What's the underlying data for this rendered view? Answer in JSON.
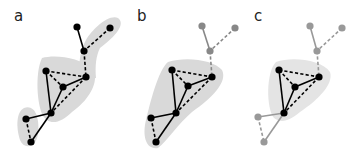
{
  "figure": {
    "panels": [
      {
        "id": "a",
        "label": "a",
        "label_pos": [
          14,
          21
        ],
        "highlight_regions": [
          {
            "name": "top-arm",
            "path": "M 86 40 C 92 30 108 14 118 18 C 126 24 116 36 100 48 C 96 56 95 66 96 78 L 80 80 C 78 64 80 50 86 40 Z",
            "color": "#d9d9d9"
          },
          {
            "name": "core",
            "path": "M 42 58 C 56 54 80 58 92 68 C 100 78 92 98 72 112 C 60 124 48 126 42 114 C 36 98 36 70 42 58 Z",
            "color": "#d9d9d9"
          },
          {
            "name": "bottom",
            "path": "M 24 108 C 34 104 40 116 38 134 C 36 148 24 150 20 140 C 16 128 16 112 24 108 Z",
            "color": "#d9d9d9"
          }
        ],
        "nodes": [
          {
            "id": 1,
            "x": 77,
            "y": 27,
            "color": "#000000"
          },
          {
            "id": 2,
            "x": 110,
            "y": 28,
            "color": "#000000"
          },
          {
            "id": 3,
            "x": 84,
            "y": 51,
            "color": "#000000"
          },
          {
            "id": 4,
            "x": 46,
            "y": 71,
            "color": "#000000"
          },
          {
            "id": 5,
            "x": 86,
            "y": 77,
            "color": "#000000"
          },
          {
            "id": 6,
            "x": 63,
            "y": 87,
            "color": "#000000"
          },
          {
            "id": 7,
            "x": 51,
            "y": 113,
            "color": "#000000"
          },
          {
            "id": 8,
            "x": 26,
            "y": 119,
            "color": "#000000"
          },
          {
            "id": 9,
            "x": 31,
            "y": 142,
            "color": "#000000"
          }
        ],
        "edges": [
          {
            "from": 1,
            "to": 3,
            "style": "solid",
            "color": "#000000"
          },
          {
            "from": 2,
            "to": 3,
            "style": "dashed",
            "color": "#000000"
          },
          {
            "from": 3,
            "to": 5,
            "style": "dashed",
            "color": "#000000"
          },
          {
            "from": 4,
            "to": 5,
            "style": "dashed",
            "color": "#000000"
          },
          {
            "from": 4,
            "to": 6,
            "style": "dashed",
            "color": "#000000"
          },
          {
            "from": 4,
            "to": 7,
            "style": "solid",
            "color": "#000000"
          },
          {
            "from": 6,
            "to": 5,
            "style": "solid",
            "color": "#000000"
          },
          {
            "from": 6,
            "to": 7,
            "style": "solid",
            "color": "#000000"
          },
          {
            "from": 5,
            "to": 7,
            "style": "dashed",
            "color": "#000000"
          },
          {
            "from": 7,
            "to": 8,
            "style": "solid",
            "color": "#000000"
          },
          {
            "from": 7,
            "to": 9,
            "style": "solid",
            "color": "#000000"
          },
          {
            "from": 8,
            "to": 9,
            "style": "dashed",
            "color": "#000000"
          }
        ]
      },
      {
        "id": "b",
        "label": "b",
        "label_pos": [
          137,
          21
        ],
        "highlight_regions": [
          {
            "name": "main",
            "path": "M 168 62 C 186 56 214 60 222 70 C 228 82 212 98 192 112 C 178 124 168 140 158 148 C 146 150 142 136 146 120 C 150 104 158 70 168 62 Z",
            "color": "#d9d9d9"
          }
        ],
        "nodes": [
          {
            "id": 1,
            "x": 202,
            "y": 26,
            "color": "#888888"
          },
          {
            "id": 2,
            "x": 235,
            "y": 28,
            "color": "#888888"
          },
          {
            "id": 3,
            "x": 210,
            "y": 51,
            "color": "#888888"
          },
          {
            "id": 4,
            "x": 172,
            "y": 70,
            "color": "#000000"
          },
          {
            "id": 5,
            "x": 212,
            "y": 77,
            "color": "#000000"
          },
          {
            "id": 6,
            "x": 188,
            "y": 86,
            "color": "#000000"
          },
          {
            "id": 7,
            "x": 176,
            "y": 113,
            "color": "#000000"
          },
          {
            "id": 8,
            "x": 151,
            "y": 118,
            "color": "#000000"
          },
          {
            "id": 9,
            "x": 156,
            "y": 142,
            "color": "#000000"
          }
        ],
        "edges": [
          {
            "from": 1,
            "to": 3,
            "style": "solid",
            "color": "#888888"
          },
          {
            "from": 2,
            "to": 3,
            "style": "dashed",
            "color": "#888888"
          },
          {
            "from": 3,
            "to": 5,
            "style": "dashed",
            "color": "#888888"
          },
          {
            "from": 4,
            "to": 5,
            "style": "dashed",
            "color": "#000000"
          },
          {
            "from": 4,
            "to": 6,
            "style": "dashed",
            "color": "#000000"
          },
          {
            "from": 4,
            "to": 7,
            "style": "solid",
            "color": "#000000"
          },
          {
            "from": 6,
            "to": 5,
            "style": "solid",
            "color": "#000000"
          },
          {
            "from": 6,
            "to": 7,
            "style": "solid",
            "color": "#000000"
          },
          {
            "from": 5,
            "to": 7,
            "style": "dashed",
            "color": "#000000"
          },
          {
            "from": 7,
            "to": 8,
            "style": "solid",
            "color": "#000000"
          },
          {
            "from": 7,
            "to": 9,
            "style": "solid",
            "color": "#000000"
          },
          {
            "from": 8,
            "to": 9,
            "style": "dashed",
            "color": "#000000"
          }
        ]
      },
      {
        "id": "c",
        "label": "c",
        "label_pos": [
          254,
          21
        ],
        "highlight_regions": [
          {
            "name": "triangle",
            "path": "M 276 62 C 292 56 322 60 330 72 C 334 84 318 100 300 112 C 290 120 282 124 274 118 C 266 108 266 72 276 62 Z",
            "color": "#e4e4e4"
          }
        ],
        "nodes": [
          {
            "id": 1,
            "x": 310,
            "y": 26,
            "color": "#999999"
          },
          {
            "id": 2,
            "x": 342,
            "y": 28,
            "color": "#999999"
          },
          {
            "id": 3,
            "x": 317,
            "y": 51,
            "color": "#999999"
          },
          {
            "id": 4,
            "x": 279,
            "y": 70,
            "color": "#000000"
          },
          {
            "id": 5,
            "x": 319,
            "y": 77,
            "color": "#000000"
          },
          {
            "id": 6,
            "x": 295,
            "y": 87,
            "color": "#000000"
          },
          {
            "id": 7,
            "x": 284,
            "y": 113,
            "color": "#000000"
          },
          {
            "id": 8,
            "x": 258,
            "y": 117,
            "color": "#999999"
          },
          {
            "id": 9,
            "x": 264,
            "y": 142,
            "color": "#999999"
          }
        ],
        "edges": [
          {
            "from": 1,
            "to": 3,
            "style": "solid",
            "color": "#999999"
          },
          {
            "from": 2,
            "to": 3,
            "style": "dashed",
            "color": "#999999"
          },
          {
            "from": 3,
            "to": 5,
            "style": "dashed",
            "color": "#999999"
          },
          {
            "from": 4,
            "to": 5,
            "style": "dashed",
            "color": "#000000"
          },
          {
            "from": 4,
            "to": 6,
            "style": "dashed",
            "color": "#000000"
          },
          {
            "from": 4,
            "to": 7,
            "style": "solid",
            "color": "#000000"
          },
          {
            "from": 6,
            "to": 5,
            "style": "solid",
            "color": "#000000"
          },
          {
            "from": 6,
            "to": 7,
            "style": "solid",
            "color": "#000000"
          },
          {
            "from": 5,
            "to": 7,
            "style": "dashed",
            "color": "#000000"
          },
          {
            "from": 7,
            "to": 8,
            "style": "solid",
            "color": "#999999"
          },
          {
            "from": 7,
            "to": 9,
            "style": "solid",
            "color": "#999999"
          },
          {
            "from": 8,
            "to": 9,
            "style": "dashed",
            "color": "#999999"
          }
        ]
      }
    ],
    "style": {
      "node_radius": 3.6,
      "edge_width": 1.6,
      "dash_pattern": "3.2 2.2"
    }
  }
}
